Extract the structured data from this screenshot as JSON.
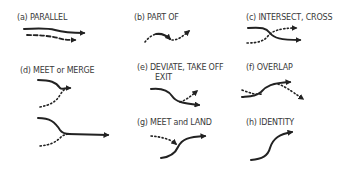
{
  "panels": [
    {
      "id": "a",
      "label": "(a) PARALLEL"
    },
    {
      "id": "b",
      "label": "(b) PART OF"
    },
    {
      "id": "c",
      "label": "(c) INTERSECT,  CROSS"
    },
    {
      "id": "d",
      "label": "(d)  MEET or  MERGE"
    },
    {
      "id": "e",
      "label": "(e) DEVIATE, TAKE OFF",
      "label2": "EXIT"
    },
    {
      "id": "f",
      "label": "(f) OVERLAP"
    },
    {
      "id": "g",
      "label": "(g) MEET and LAND"
    },
    {
      "id": "h",
      "label": "(h) IDENTITY"
    }
  ],
  "colors": {
    "stroke": "#222222",
    "text": "#3a3a3a"
  }
}
